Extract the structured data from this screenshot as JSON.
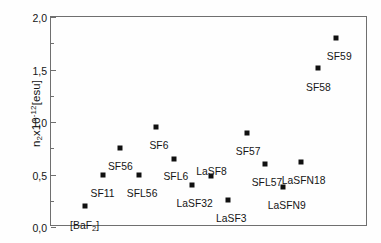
{
  "chart_data": {
    "type": "scatter",
    "title": "",
    "xlabel": "",
    "ylabel": "n2x10-12[esu]",
    "ylabel_parts": {
      "base": "n",
      "sub": "2",
      "mid": "x10",
      "sup": "-12",
      "tail": "[esu]"
    },
    "ylim": [
      0.0,
      2.0
    ],
    "ytick_labels": [
      "0,0",
      "0,5",
      "1,0",
      "1,5",
      "2,0"
    ],
    "ytick_values": [
      0.0,
      0.5,
      1.0,
      1.5,
      2.0
    ],
    "yminor_values": [
      0.25,
      0.75,
      1.25,
      1.75
    ],
    "xlim": [
      0,
      16
    ],
    "xtick_labels": [],
    "grid": false,
    "legend": false,
    "marker_style": "filled-square",
    "marker_color": "#101010",
    "points": [
      {
        "label": "[BaF2]",
        "label_html": "[BaF<sub>2</sub>]",
        "x": 1.7,
        "y": 0.2,
        "lx": 1.7,
        "ly": 0.07
      },
      {
        "label": "SF11",
        "label_html": "SF11",
        "x": 2.6,
        "y": 0.5,
        "lx": 2.6,
        "ly": 0.375
      },
      {
        "label": "SF56",
        "label_html": "SF56",
        "x": 3.5,
        "y": 0.75,
        "lx": 3.5,
        "ly": 0.625
      },
      {
        "label": "SFL56",
        "label_html": "SFL56",
        "x": 4.45,
        "y": 0.5,
        "lx": 4.6,
        "ly": 0.375
      },
      {
        "label": "SF6",
        "label_html": "SF6",
        "x": 5.3,
        "y": 0.95,
        "lx": 5.45,
        "ly": 0.825
      },
      {
        "label": "SFL6",
        "label_html": "SFL6",
        "x": 6.2,
        "y": 0.65,
        "lx": 6.3,
        "ly": 0.53
      },
      {
        "label": "LaSF32",
        "label_html": "LaSF32",
        "x": 7.1,
        "y": 0.4,
        "lx": 7.25,
        "ly": 0.275
      },
      {
        "label": "LaSF8",
        "label_html": "LaSF8",
        "x": 8.1,
        "y": 0.49,
        "lx": 8.1,
        "ly": 0.585
      },
      {
        "label": "LaSF3",
        "label_html": "LaSF3",
        "x": 8.95,
        "y": 0.26,
        "lx": 9.1,
        "ly": 0.135
      },
      {
        "label": "SF57",
        "label_html": "SF57",
        "x": 9.9,
        "y": 0.9,
        "lx": 9.95,
        "ly": 0.775
      },
      {
        "label": "SFL57",
        "label_html": "SFL57",
        "x": 10.8,
        "y": 0.6,
        "lx": 10.9,
        "ly": 0.475
      },
      {
        "label": "LaSFN9",
        "label_html": "LaSFN9",
        "x": 11.7,
        "y": 0.38,
        "lx": 11.9,
        "ly": 0.255
      },
      {
        "label": "LaSFN18",
        "label_html": "LaSFN18",
        "x": 12.6,
        "y": 0.62,
        "lx": 12.75,
        "ly": 0.495
      },
      {
        "label": "SF58",
        "label_html": "SF58",
        "x": 13.5,
        "y": 1.51,
        "lx": 13.5,
        "ly": 1.385
      },
      {
        "label": "SF59",
        "label_html": "SF59",
        "x": 14.4,
        "y": 1.8,
        "lx": 14.55,
        "ly": 1.675
      }
    ]
  }
}
